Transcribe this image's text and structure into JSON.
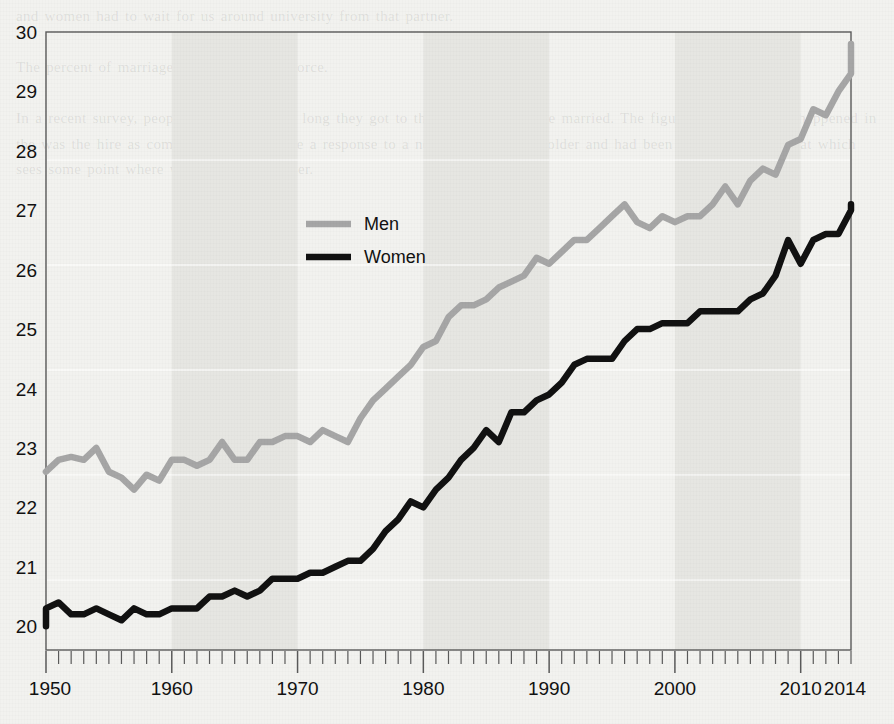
{
  "page": {
    "background_color": "#f2f2ef",
    "bleed_text": "and women had to wait for us around university from that partner.\n\nThe percent of marriages that ended in divorce.\n\nIn a recent survey, people were asked how long they got to the age the they were married. The figures followed what happened in the was the hire as compared to the income a response to a necessary a percent older and had been the only change that which sees some point where women's their partner."
  },
  "chart_data": {
    "type": "line",
    "title": "",
    "subtitle": "",
    "xlabel": "",
    "ylabel": "",
    "xlim": [
      1950,
      2014
    ],
    "ylim": [
      19.6,
      30
    ],
    "grid": false,
    "legend_position": "inside-upper-left",
    "x_tick_labels": [
      "1950",
      "1960",
      "1970",
      "1980",
      "1990",
      "2000",
      "2010",
      "2014"
    ],
    "x_tick_values": [
      1950,
      1960,
      1970,
      1980,
      1990,
      2000,
      2010,
      2014
    ],
    "y_tick_labels": [
      "20",
      "21",
      "22",
      "23",
      "24",
      "25",
      "26",
      "27",
      "28",
      "29",
      "30"
    ],
    "y_tick_values": [
      20,
      21,
      22,
      23,
      24,
      25,
      26,
      27,
      28,
      29,
      30
    ],
    "minor_x_tick_interval": 1,
    "x": [
      1950,
      1951,
      1952,
      1953,
      1954,
      1955,
      1956,
      1957,
      1958,
      1959,
      1960,
      1961,
      1962,
      1963,
      1964,
      1965,
      1966,
      1967,
      1968,
      1969,
      1970,
      1971,
      1972,
      1973,
      1974,
      1975,
      1976,
      1977,
      1978,
      1979,
      1980,
      1981,
      1982,
      1983,
      1984,
      1985,
      1986,
      1987,
      1988,
      1989,
      1990,
      1991,
      1992,
      1993,
      1994,
      1995,
      1996,
      1997,
      1998,
      1999,
      2000,
      2001,
      2002,
      2003,
      2004,
      2005,
      2006,
      2007,
      2008,
      2009,
      2010,
      2011,
      2012,
      2013,
      2014
    ],
    "series": [
      {
        "name": "Men",
        "color": "#a6a6a6",
        "values": [
          22.6,
          22.8,
          22.85,
          22.8,
          23.0,
          22.6,
          22.5,
          22.3,
          22.55,
          22.45,
          22.8,
          22.8,
          22.7,
          22.8,
          23.1,
          22.8,
          22.8,
          23.1,
          23.1,
          23.2,
          23.2,
          23.1,
          23.3,
          23.2,
          23.1,
          23.5,
          23.8,
          24.0,
          24.2,
          24.4,
          24.7,
          24.8,
          25.2,
          25.4,
          25.4,
          25.5,
          25.7,
          25.8,
          25.9,
          26.2,
          26.1,
          26.3,
          26.5,
          26.5,
          26.7,
          26.9,
          27.1,
          26.8,
          26.7,
          26.9,
          26.8,
          26.9,
          26.9,
          27.1,
          27.4,
          27.1,
          27.5,
          27.7,
          27.6,
          28.1,
          28.2,
          28.7,
          28.6,
          29.0,
          29.3
        ],
        "endpoint_value": 29.8,
        "start_value": 22.6
      },
      {
        "name": "Women",
        "color": "#111111",
        "values": [
          20.3,
          20.4,
          20.2,
          20.2,
          20.3,
          20.2,
          20.1,
          20.3,
          20.2,
          20.2,
          20.3,
          20.3,
          20.3,
          20.5,
          20.5,
          20.6,
          20.5,
          20.6,
          20.8,
          20.8,
          20.8,
          20.9,
          20.9,
          21.0,
          21.1,
          21.1,
          21.3,
          21.6,
          21.8,
          22.1,
          22.0,
          22.3,
          22.5,
          22.8,
          23.0,
          23.3,
          23.1,
          23.6,
          23.6,
          23.8,
          23.9,
          24.1,
          24.4,
          24.5,
          24.5,
          24.5,
          24.8,
          25.0,
          25.0,
          25.1,
          25.1,
          25.1,
          25.3,
          25.3,
          25.3,
          25.3,
          25.5,
          25.6,
          25.9,
          26.5,
          26.1,
          26.5,
          26.6,
          26.6,
          27.0
        ],
        "endpoint_value": 27.1,
        "start_value": 20.0
      }
    ],
    "legend": [
      {
        "label": "Men",
        "color": "#a6a6a6"
      },
      {
        "label": "Women",
        "color": "#111111"
      }
    ]
  }
}
